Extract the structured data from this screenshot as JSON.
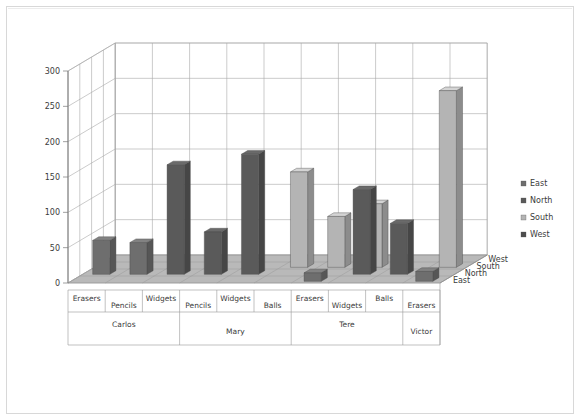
{
  "chart_data": {
    "type": "bar",
    "subtype": "3d-clustered-column",
    "title": "",
    "xlabel": "",
    "ylabel": "",
    "ylim": [
      0,
      300
    ],
    "ytick_values": [
      0,
      50,
      100,
      150,
      200,
      250,
      300
    ],
    "ytick_labels": [
      "0",
      "50",
      "100",
      "150",
      "200",
      "250",
      "300"
    ],
    "grid": true,
    "legend_position": "right",
    "depth_axis_name": "Region",
    "depth_categories": [
      "East",
      "North",
      "South",
      "West"
    ],
    "legend": [
      "East",
      "North",
      "South",
      "West"
    ],
    "series": [
      {
        "name": "East",
        "values": [
          0,
          0,
          0,
          0,
          0,
          0,
          12,
          0,
          0,
          14
        ]
      },
      {
        "name": "North",
        "values": [
          48,
          45,
          155,
          60,
          170,
          0,
          0,
          120,
          72,
          0
        ]
      },
      {
        "name": "South",
        "values": [
          0,
          0,
          0,
          0,
          0,
          135,
          72,
          90,
          0,
          250
        ]
      },
      {
        "name": "West",
        "values": [
          0,
          0,
          0,
          0,
          0,
          0,
          0,
          0,
          0,
          0
        ]
      }
    ],
    "categories": [
      "Erasers",
      "Pencils",
      "Widgets",
      "Pencils",
      "Widgets",
      "Balls",
      "Erasers",
      "Widgets",
      "Balls",
      "Erasers"
    ],
    "groups": [
      {
        "label": "Carlos",
        "categories": [
          "Erasers",
          "Pencils",
          "Widgets"
        ]
      },
      {
        "label": "Mary",
        "categories": [
          "Pencils",
          "Widgets",
          "Balls"
        ]
      },
      {
        "label": "Tere",
        "categories": [
          "Erasers",
          "Widgets",
          "Balls"
        ]
      },
      {
        "label": "Victor",
        "categories": [
          "Erasers"
        ]
      }
    ],
    "bars": [
      {
        "category": "Erasers",
        "group": "Carlos",
        "region": "North",
        "value": 48,
        "col": 0,
        "row": 1,
        "color": "#6e6e6e"
      },
      {
        "category": "Pencils",
        "group": "Carlos",
        "region": "North",
        "value": 45,
        "col": 1,
        "row": 1,
        "color": "#6e6e6e"
      },
      {
        "category": "Widgets",
        "group": "Carlos",
        "region": "North",
        "value": 155,
        "col": 2,
        "row": 1,
        "color": "#5a5a5a"
      },
      {
        "category": "Pencils",
        "group": "Mary",
        "region": "North",
        "value": 60,
        "col": 3,
        "row": 1,
        "color": "#5a5a5a"
      },
      {
        "category": "Widgets",
        "group": "Mary",
        "region": "North",
        "value": 170,
        "col": 4,
        "row": 1,
        "color": "#5a5a5a"
      },
      {
        "category": "Balls",
        "group": "Mary",
        "region": "South",
        "value": 135,
        "col": 5,
        "row": 2,
        "color": "#b4b4b4"
      },
      {
        "category": "Erasers",
        "group": "Tere",
        "region": "South",
        "value": 72,
        "col": 6,
        "row": 2,
        "color": "#b4b4b4"
      },
      {
        "category": "Erasers",
        "group": "Tere",
        "region": "East",
        "value": 12,
        "col": 6,
        "row": 0,
        "color": "#6e6e6e"
      },
      {
        "category": "Widgets",
        "group": "Tere",
        "region": "North",
        "value": 120,
        "col": 7,
        "row": 1,
        "color": "#5a5a5a"
      },
      {
        "category": "Widgets",
        "group": "Tere",
        "region": "South",
        "value": 90,
        "col": 7,
        "row": 2,
        "color": "#b4b4b4"
      },
      {
        "category": "Balls",
        "group": "Victor",
        "region": "North",
        "value": 72,
        "col": 8,
        "row": 1,
        "color": "#5a5a5a"
      },
      {
        "category": "Erasers",
        "group": "Victor",
        "region": "South",
        "value": 250,
        "col": 9,
        "row": 2,
        "color": "#b4b4b4"
      },
      {
        "category": "Erasers",
        "group": "Victor",
        "region": "East",
        "value": 14,
        "col": 9,
        "row": 0,
        "color": "#6e6e6e"
      }
    ]
  },
  "axis": {
    "y_ticks": [
      "300",
      "250",
      "200",
      "150",
      "100",
      "50",
      "0"
    ],
    "depth_labels": [
      "West",
      "South",
      "North",
      "East"
    ]
  },
  "category_labels": [
    {
      "text": "Erasers"
    },
    {
      "text": "Pencils"
    },
    {
      "text": "Widgets"
    },
    {
      "text": "Pencils"
    },
    {
      "text": "Widgets"
    },
    {
      "text": "Balls"
    },
    {
      "text": "Erasers"
    },
    {
      "text": "Widgets"
    },
    {
      "text": "Balls"
    },
    {
      "text": "Erasers"
    }
  ],
  "group_labels": [
    {
      "text": "Carlos"
    },
    {
      "text": "Mary"
    },
    {
      "text": "Tere"
    },
    {
      "text": "Victor"
    }
  ],
  "legend": {
    "items": [
      {
        "label": "East",
        "color": "#6e6e6e"
      },
      {
        "label": "North",
        "color": "#5a5a5a"
      },
      {
        "label": "South",
        "color": "#b4b4b4"
      },
      {
        "label": "West",
        "color": "#4d4d4d"
      }
    ]
  },
  "colors": {
    "wall": "#ffffff",
    "floor": "#b9b9b9",
    "grid": "#a8a8a8",
    "frame": "#d8d8d8",
    "text": "#3b3b3b"
  }
}
